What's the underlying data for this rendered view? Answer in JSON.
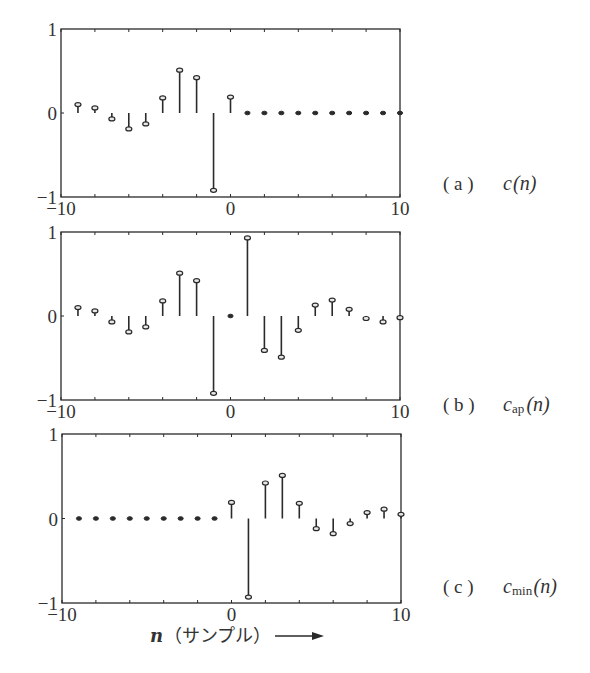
{
  "chart_data": [
    {
      "type": "stem",
      "id": "a",
      "title": "(a)  c(n)",
      "label_tag": "( a )",
      "label_func": "c",
      "label_sub": "",
      "label_arg": "(n)",
      "xlim": [
        -10,
        10
      ],
      "ylim": [
        -1,
        1
      ],
      "xticks": [
        -10,
        0,
        10
      ],
      "yticks": [
        1,
        0,
        -1
      ],
      "x": [
        -9,
        -8,
        -7,
        -6,
        -5,
        -4,
        -3,
        -2,
        -1,
        0,
        1,
        2,
        3,
        4,
        5,
        6,
        7,
        8,
        9,
        10
      ],
      "values": [
        0.1,
        0.06,
        -0.07,
        -0.19,
        -0.13,
        0.18,
        0.51,
        0.42,
        -0.92,
        0.19,
        0,
        0,
        0,
        0,
        0,
        0,
        0,
        0,
        0,
        0
      ]
    },
    {
      "type": "stem",
      "id": "b",
      "title": "(b)  c_ap(n)",
      "label_tag": "( b )",
      "label_func": "c",
      "label_sub": "ap",
      "label_arg": "(n)",
      "xlim": [
        -10,
        10
      ],
      "ylim": [
        -1,
        1
      ],
      "xticks": [
        -10,
        0,
        10
      ],
      "yticks": [
        1,
        0,
        -1
      ],
      "x": [
        -9,
        -8,
        -7,
        -6,
        -5,
        -4,
        -3,
        -2,
        -1,
        0,
        1,
        2,
        3,
        4,
        5,
        6,
        7,
        8,
        9,
        10
      ],
      "values": [
        0.1,
        0.06,
        -0.07,
        -0.19,
        -0.13,
        0.18,
        0.51,
        0.42,
        -0.92,
        0,
        0.93,
        -0.41,
        -0.49,
        -0.17,
        0.13,
        0.19,
        0.08,
        -0.03,
        -0.07,
        -0.02
      ]
    },
    {
      "type": "stem",
      "id": "c",
      "title": "(c)  c_min(n)",
      "label_tag": "( c )",
      "label_func": "c",
      "label_sub": "min",
      "label_arg": "(n)",
      "xlim": [
        -10,
        10
      ],
      "ylim": [
        -1,
        1
      ],
      "xticks": [
        -10,
        0,
        10
      ],
      "yticks": [
        1,
        0,
        -1
      ],
      "x": [
        -9,
        -8,
        -7,
        -6,
        -5,
        -4,
        -3,
        -2,
        -1,
        0,
        1,
        2,
        3,
        4,
        5,
        6,
        7,
        8,
        9,
        10
      ],
      "values": [
        0,
        0,
        0,
        0,
        0,
        0,
        0,
        0,
        0,
        0.19,
        -0.93,
        0.42,
        0.51,
        0.18,
        -0.12,
        -0.18,
        -0.06,
        0.07,
        0.11,
        0.05
      ]
    }
  ],
  "xlabel": {
    "var": "n",
    "text": "（サンプル）",
    "arrow": "right-arrow"
  },
  "colors": {
    "ink": "#2a2a2a",
    "background": "#ffffff"
  }
}
